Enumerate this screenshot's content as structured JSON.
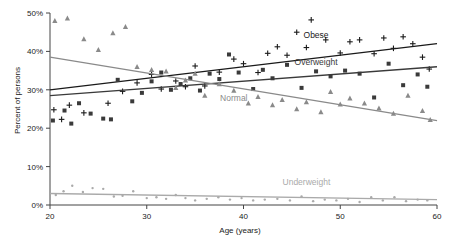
{
  "chart_data": {
    "type": "scatter",
    "title": "",
    "xlabel": "Age (years)",
    "ylabel": "Percent of persons",
    "xlim": [
      20,
      60
    ],
    "ylim": [
      0,
      50
    ],
    "xticks": [
      20,
      30,
      40,
      50,
      60
    ],
    "xtick_labels": [
      "20",
      "30",
      "40",
      "50",
      "60"
    ],
    "yticks": [
      0,
      10,
      20,
      30,
      40,
      50
    ],
    "ytick_labels": [
      "0%",
      "10%",
      "20%",
      "30%",
      "40%",
      "50%"
    ],
    "grid": false,
    "legend_position": "inline-annotations",
    "series": [
      {
        "name": "Obese",
        "marker": "plus",
        "color": "#1a1a1a",
        "label_x": 47.5,
        "label_y": 43.5,
        "trend": {
          "x": [
            20,
            60
          ],
          "y": [
            30.0,
            42.0
          ]
        },
        "points": [
          {
            "x": 20.4,
            "y": 24.8
          },
          {
            "x": 21.2,
            "y": 22.3
          },
          {
            "x": 22.0,
            "y": 26.0
          },
          {
            "x": 23.5,
            "y": 24.0
          },
          {
            "x": 26.0,
            "y": 26.5
          },
          {
            "x": 27.5,
            "y": 29.6
          },
          {
            "x": 29.0,
            "y": 31.8
          },
          {
            "x": 30.5,
            "y": 34.0
          },
          {
            "x": 31.5,
            "y": 30.2
          },
          {
            "x": 33.0,
            "y": 32.3
          },
          {
            "x": 34.0,
            "y": 30.8
          },
          {
            "x": 35.0,
            "y": 36.2
          },
          {
            "x": 36.0,
            "y": 31.0
          },
          {
            "x": 37.5,
            "y": 34.6
          },
          {
            "x": 39.0,
            "y": 38.0
          },
          {
            "x": 40.0,
            "y": 36.8
          },
          {
            "x": 41.5,
            "y": 34.5
          },
          {
            "x": 42.5,
            "y": 39.5
          },
          {
            "x": 43.5,
            "y": 41.2
          },
          {
            "x": 44.5,
            "y": 39.0
          },
          {
            "x": 45.5,
            "y": 45.0
          },
          {
            "x": 46.5,
            "y": 41.0
          },
          {
            "x": 47.0,
            "y": 48.2
          },
          {
            "x": 48.5,
            "y": 43.0
          },
          {
            "x": 50.0,
            "y": 39.6
          },
          {
            "x": 51.0,
            "y": 42.5
          },
          {
            "x": 52.0,
            "y": 43.0
          },
          {
            "x": 53.5,
            "y": 39.4
          },
          {
            "x": 54.5,
            "y": 43.5
          },
          {
            "x": 55.5,
            "y": 40.8
          },
          {
            "x": 56.5,
            "y": 43.8
          },
          {
            "x": 57.5,
            "y": 42.0
          },
          {
            "x": 58.5,
            "y": 38.5
          },
          {
            "x": 59.2,
            "y": 35.4
          }
        ]
      },
      {
        "name": "Overweight",
        "marker": "square",
        "color": "#3a3a3a",
        "label_x": 47.5,
        "label_y": 36.5,
        "trend": {
          "x": [
            20,
            60
          ],
          "y": [
            28.5,
            36.0
          ]
        },
        "points": [
          {
            "x": 20.3,
            "y": 22.0
          },
          {
            "x": 21.5,
            "y": 24.6
          },
          {
            "x": 22.2,
            "y": 21.2
          },
          {
            "x": 23.0,
            "y": 26.5
          },
          {
            "x": 24.2,
            "y": 23.8
          },
          {
            "x": 25.5,
            "y": 22.5
          },
          {
            "x": 26.3,
            "y": 22.3
          },
          {
            "x": 27.0,
            "y": 32.6
          },
          {
            "x": 28.5,
            "y": 27.0
          },
          {
            "x": 29.5,
            "y": 29.2
          },
          {
            "x": 30.5,
            "y": 32.2
          },
          {
            "x": 31.5,
            "y": 34.5
          },
          {
            "x": 32.5,
            "y": 30.0
          },
          {
            "x": 33.5,
            "y": 31.5
          },
          {
            "x": 34.5,
            "y": 33.0
          },
          {
            "x": 35.5,
            "y": 29.8
          },
          {
            "x": 36.5,
            "y": 34.2
          },
          {
            "x": 37.5,
            "y": 32.8
          },
          {
            "x": 38.5,
            "y": 39.2
          },
          {
            "x": 39.5,
            "y": 34.5
          },
          {
            "x": 41.0,
            "y": 30.2
          },
          {
            "x": 42.0,
            "y": 35.2
          },
          {
            "x": 43.0,
            "y": 33.0
          },
          {
            "x": 44.5,
            "y": 36.5
          },
          {
            "x": 46.0,
            "y": 30.5
          },
          {
            "x": 47.5,
            "y": 34.8
          },
          {
            "x": 49.0,
            "y": 33.5
          },
          {
            "x": 50.5,
            "y": 35.0
          },
          {
            "x": 52.0,
            "y": 34.2
          },
          {
            "x": 53.5,
            "y": 28.0
          },
          {
            "x": 55.0,
            "y": 36.8
          },
          {
            "x": 56.5,
            "y": 31.2
          },
          {
            "x": 58.0,
            "y": 34.0
          },
          {
            "x": 59.0,
            "y": 30.8
          }
        ]
      },
      {
        "name": "Normal",
        "marker": "triangle",
        "color": "#8a8a8a",
        "label_x": 39.0,
        "label_y": 27.0,
        "trend": {
          "x": [
            20,
            60
          ],
          "y": [
            38.5,
            22.0
          ]
        },
        "points": [
          {
            "x": 20.5,
            "y": 48.0
          },
          {
            "x": 21.8,
            "y": 48.6
          },
          {
            "x": 23.5,
            "y": 43.2
          },
          {
            "x": 25.0,
            "y": 40.4
          },
          {
            "x": 26.5,
            "y": 44.8
          },
          {
            "x": 27.8,
            "y": 46.4
          },
          {
            "x": 29.0,
            "y": 36.0
          },
          {
            "x": 30.5,
            "y": 35.2
          },
          {
            "x": 32.0,
            "y": 34.8
          },
          {
            "x": 33.0,
            "y": 30.5
          },
          {
            "x": 34.0,
            "y": 32.5
          },
          {
            "x": 35.0,
            "y": 34.2
          },
          {
            "x": 36.0,
            "y": 28.5
          },
          {
            "x": 37.5,
            "y": 31.5
          },
          {
            "x": 39.0,
            "y": 29.8
          },
          {
            "x": 40.5,
            "y": 26.5
          },
          {
            "x": 41.5,
            "y": 28.2
          },
          {
            "x": 43.0,
            "y": 26.0
          },
          {
            "x": 44.0,
            "y": 27.4
          },
          {
            "x": 45.5,
            "y": 25.0
          },
          {
            "x": 46.5,
            "y": 26.8
          },
          {
            "x": 48.0,
            "y": 24.2
          },
          {
            "x": 49.0,
            "y": 29.5
          },
          {
            "x": 50.0,
            "y": 26.2
          },
          {
            "x": 51.0,
            "y": 27.8
          },
          {
            "x": 52.5,
            "y": 26.5
          },
          {
            "x": 54.0,
            "y": 25.2
          },
          {
            "x": 55.5,
            "y": 23.8
          },
          {
            "x": 57.0,
            "y": 28.5
          },
          {
            "x": 58.5,
            "y": 24.5
          },
          {
            "x": 59.3,
            "y": 22.2
          }
        ]
      },
      {
        "name": "Underweight",
        "marker": "dot",
        "color": "#aaaaaa",
        "label_x": 46.5,
        "label_y": 5.2,
        "trend": {
          "x": [
            20,
            60
          ],
          "y": [
            3.0,
            1.4
          ]
        },
        "points": [
          {
            "x": 20.6,
            "y": 2.6
          },
          {
            "x": 21.4,
            "y": 3.6
          },
          {
            "x": 22.3,
            "y": 5.0
          },
          {
            "x": 23.4,
            "y": 3.4
          },
          {
            "x": 24.4,
            "y": 4.4
          },
          {
            "x": 25.5,
            "y": 4.2
          },
          {
            "x": 26.6,
            "y": 2.2
          },
          {
            "x": 27.5,
            "y": 2.4
          },
          {
            "x": 28.6,
            "y": 3.6
          },
          {
            "x": 30.0,
            "y": 1.8
          },
          {
            "x": 31.0,
            "y": 2.0
          },
          {
            "x": 32.0,
            "y": 1.6
          },
          {
            "x": 33.0,
            "y": 2.6
          },
          {
            "x": 34.0,
            "y": 1.8
          },
          {
            "x": 35.0,
            "y": 1.2
          },
          {
            "x": 36.2,
            "y": 1.6
          },
          {
            "x": 37.4,
            "y": 2.0
          },
          {
            "x": 38.6,
            "y": 1.4
          },
          {
            "x": 39.8,
            "y": 1.8
          },
          {
            "x": 41.0,
            "y": 1.2
          },
          {
            "x": 42.2,
            "y": 1.4
          },
          {
            "x": 43.5,
            "y": 1.6
          },
          {
            "x": 44.8,
            "y": 1.2
          },
          {
            "x": 46.0,
            "y": 2.2
          },
          {
            "x": 47.2,
            "y": 1.0
          },
          {
            "x": 48.4,
            "y": 1.4
          },
          {
            "x": 49.6,
            "y": 1.2
          },
          {
            "x": 50.8,
            "y": 1.6
          },
          {
            "x": 52.0,
            "y": 0.8
          },
          {
            "x": 53.2,
            "y": 2.0
          },
          {
            "x": 54.4,
            "y": 1.2
          },
          {
            "x": 55.6,
            "y": 2.0
          },
          {
            "x": 56.8,
            "y": 1.0
          },
          {
            "x": 58.0,
            "y": 1.4
          },
          {
            "x": 59.0,
            "y": 1.2
          }
        ]
      }
    ]
  }
}
